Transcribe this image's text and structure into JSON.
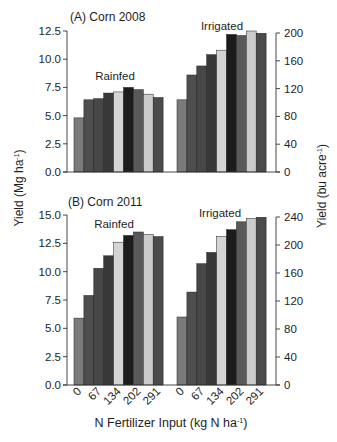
{
  "figure": {
    "left_axis_label": {
      "main": "Yield (Mg ha",
      "sup": "-1",
      "end": ")"
    },
    "right_axis_label": {
      "main": "Yield (bu acre",
      "sup": "-1",
      "end": ")"
    },
    "x_axis_label": {
      "main": "N Fertilizer Input (kg N ha",
      "sup": "-1",
      "end": ")"
    }
  },
  "chart_data": [
    {
      "id": "A",
      "type": "bar",
      "title": "(A) Corn  2008",
      "xlabel": "",
      "ylabel": "Yield (Mg ha-1)",
      "y2label": "Yield (bu acre-1)",
      "ylim": [
        0,
        12.5
      ],
      "yticks": [
        "0.0",
        "2.5",
        "5.0",
        "7.5",
        "10.0",
        "12.5"
      ],
      "y2lim": [
        0,
        200
      ],
      "y2ticks": [
        "0",
        "40",
        "80",
        "120",
        "160",
        "200"
      ],
      "grid": false,
      "bar_colors": [
        "#7b7b7b",
        "#4e4e4e",
        "#474747",
        "#383838",
        "#d4d4d4",
        "#1c1c1c",
        "#595959",
        "#cbcbcb",
        "#4b4b4b"
      ],
      "series": [
        {
          "name": "Rainfed",
          "values": [
            4.8,
            6.4,
            6.5,
            7.0,
            7.1,
            7.5,
            7.3,
            6.9,
            6.6
          ]
        },
        {
          "name": "Irrigated",
          "values": [
            6.4,
            8.6,
            9.4,
            10.4,
            10.8,
            12.2,
            12.1,
            12.5,
            12.3
          ]
        }
      ]
    },
    {
      "id": "B",
      "type": "bar",
      "title": "(B) Corn  2011",
      "xlabel": "N Fertilizer Input (kg N ha-1)",
      "ylabel": "Yield (Mg ha-1)",
      "y2label": "Yield (bu acre-1)",
      "ylim": [
        0,
        15.0
      ],
      "yticks": [
        "0.0",
        "2.5",
        "5.0",
        "7.5",
        "10.0",
        "12.5",
        "15.0"
      ],
      "y2lim": [
        0,
        240
      ],
      "y2ticks": [
        "0",
        "40",
        "80",
        "120",
        "160",
        "200",
        "240"
      ],
      "grid": false,
      "xtick_labels": [
        "0",
        "67",
        "134",
        "202",
        "291"
      ],
      "xtick_bar_index": [
        0,
        2,
        4,
        6,
        8
      ],
      "bar_colors": [
        "#7b7b7b",
        "#4e4e4e",
        "#474747",
        "#383838",
        "#d4d4d4",
        "#1c1c1c",
        "#595959",
        "#cbcbcb",
        "#4b4b4b"
      ],
      "series": [
        {
          "name": "Rainfed",
          "values": [
            5.9,
            7.9,
            10.3,
            11.4,
            12.6,
            13.2,
            13.5,
            13.3,
            13.1
          ]
        },
        {
          "name": "Irrigated",
          "values": [
            6.0,
            8.2,
            10.7,
            11.7,
            13.1,
            13.7,
            14.4,
            14.7,
            14.8
          ]
        }
      ]
    }
  ]
}
